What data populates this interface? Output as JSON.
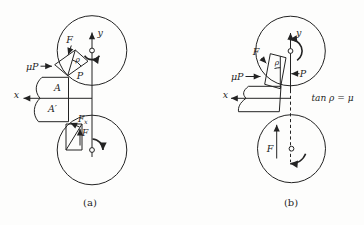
{
  "colors": {
    "background": "#fdfdfc",
    "ink": "#232323"
  },
  "fig_a": {
    "caption": "(a)",
    "labels": {
      "force_f": "F",
      "friction_mu_p": "μP",
      "angle_rho": "ρ",
      "normal_p": "P",
      "point_a": "A",
      "point_a_prime": "A′",
      "axis_x": "x",
      "axis_y": "y",
      "component_f_base": "F",
      "component_f_sub": "x",
      "force_f_lower": "F"
    }
  },
  "fig_b": {
    "caption": "(b)",
    "labels": {
      "force_f": "F",
      "friction_mu_p": "μP",
      "angle_rho": "ρ",
      "normal_p": "P",
      "axis_x": "x",
      "axis_y": "y",
      "equation": "tan ρ = μ",
      "force_f_lower": "F"
    }
  }
}
